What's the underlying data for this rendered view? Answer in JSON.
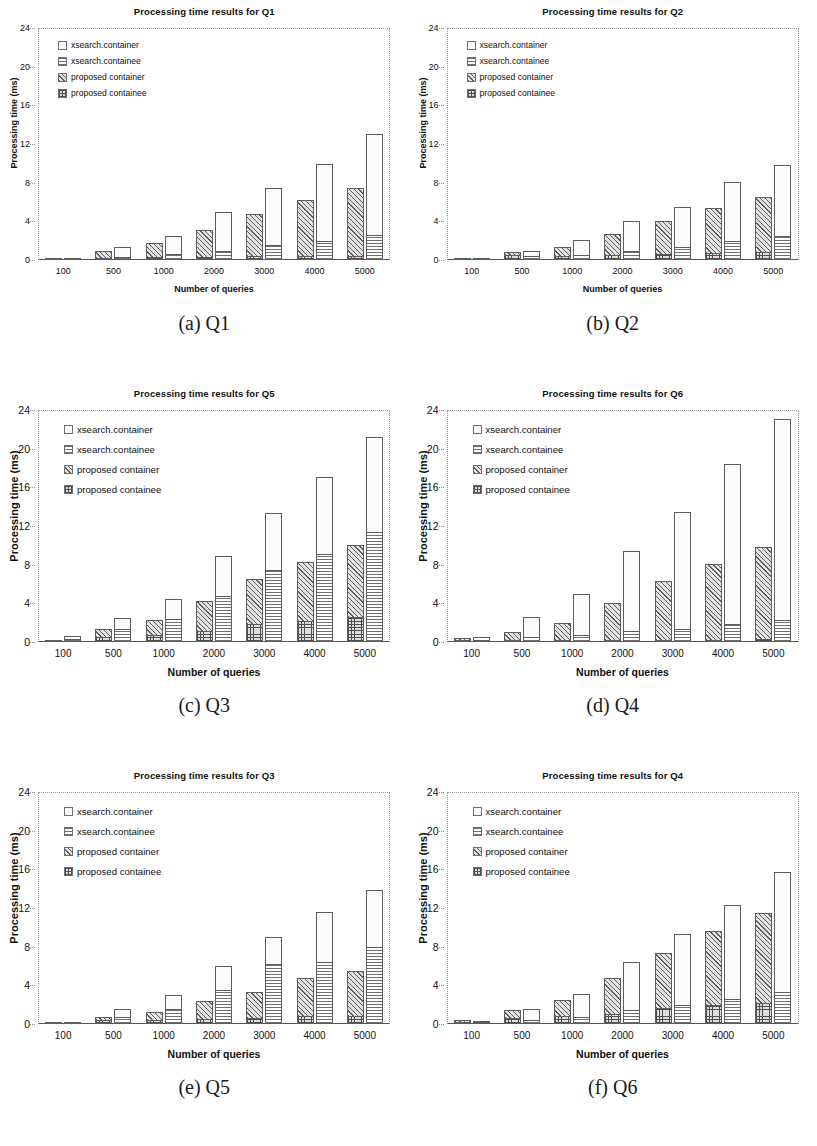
{
  "figure": {
    "axis": {
      "ylabel": "Processing time (ms)",
      "xlabel": "Number of queries",
      "yticks": [
        "0",
        "4",
        "8",
        "12",
        "16",
        "20",
        "24"
      ],
      "xticks": [
        "100",
        "500",
        "1000",
        "2000",
        "3000",
        "4000",
        "5000"
      ],
      "ymin": 0,
      "ymax": 24,
      "ystep": 4
    },
    "legend": [
      {
        "label": "xsearch.container",
        "pattern": "dots",
        "key": "xsearch_container"
      },
      {
        "label": "xsearch.containee",
        "pattern": "hlines",
        "key": "xsearch_containee"
      },
      {
        "label": "proposed  container",
        "pattern": "diag",
        "key": "proposed_container"
      },
      {
        "label": "proposed  containee",
        "pattern": "grid",
        "key": "proposed_containee"
      }
    ],
    "panels": [
      {
        "caption": "(a) Q1",
        "title": "Processing time results for Q1",
        "chart": "q1"
      },
      {
        "caption": "(b) Q2",
        "title": "Processing time results for Q2",
        "chart": "q2"
      },
      {
        "caption": "(c) Q3",
        "title": "Processing time results for Q5",
        "chart": "q5"
      },
      {
        "caption": "(d) Q4",
        "title": "Processing time results for Q6",
        "chart": "q6"
      },
      {
        "caption": "(e) Q5",
        "title": "Processing time results for Q3",
        "chart": "q3"
      },
      {
        "caption": "(f) Q6",
        "title": "Processing time results for Q4",
        "chart": "q4"
      }
    ]
  },
  "chart_data": [
    {
      "id": "q1",
      "type": "bar",
      "stacked": true,
      "title": "Processing time results for Q1",
      "xlabel": "Number of queries",
      "ylabel": "Processing time (ms)",
      "ylim": [
        0,
        24
      ],
      "yticks": [
        0,
        4,
        8,
        12,
        16,
        20,
        24
      ],
      "grid": false,
      "legend_position": "inside-top-left",
      "categories": [
        "100",
        "500",
        "1000",
        "2000",
        "3000",
        "4000",
        "5000"
      ],
      "series": [
        {
          "name": "proposed  containee",
          "values": [
            0.05,
            0.12,
            0.18,
            0.25,
            0.3,
            0.32,
            0.35
          ]
        },
        {
          "name": "proposed  container",
          "values": [
            0.1,
            0.78,
            1.62,
            2.85,
            4.5,
            5.9,
            7.1
          ]
        },
        {
          "name": "xsearch.containee",
          "values": [
            0.05,
            0.25,
            0.6,
            0.9,
            1.5,
            1.85,
            2.5
          ]
        },
        {
          "name": "xsearch.container",
          "values": [
            0.1,
            1.1,
            1.9,
            4.1,
            5.9,
            8.1,
            10.5
          ]
        }
      ],
      "totals": {
        "proposed": [
          0.15,
          0.9,
          1.8,
          3.1,
          4.8,
          6.2,
          7.45
        ],
        "xsearch": [
          0.15,
          1.35,
          2.5,
          5.0,
          7.4,
          9.95,
          13.0
        ]
      }
    },
    {
      "id": "q2",
      "type": "bar",
      "stacked": true,
      "title": "Processing time results for Q2",
      "xlabel": "Number of queries",
      "ylabel": "Processing time (ms)",
      "ylim": [
        0,
        24
      ],
      "yticks": [
        0,
        4,
        8,
        12,
        16,
        20,
        24
      ],
      "grid": false,
      "legend_position": "inside-top-left",
      "categories": [
        "100",
        "500",
        "1000",
        "2000",
        "3000",
        "4000",
        "5000"
      ],
      "series": [
        {
          "name": "proposed  containee",
          "values": [
            0.08,
            0.6,
            0.3,
            0.4,
            0.5,
            0.6,
            0.75
          ]
        },
        {
          "name": "proposed  container",
          "values": [
            0.07,
            0.2,
            1.05,
            2.3,
            3.5,
            4.75,
            5.75
          ]
        },
        {
          "name": "xsearch.containee",
          "values": [
            0.08,
            0.4,
            0.45,
            0.85,
            1.3,
            1.9,
            2.4
          ]
        },
        {
          "name": "xsearch.container",
          "values": [
            0.07,
            0.5,
            1.65,
            3.15,
            4.2,
            6.2,
            7.4
          ]
        }
      ],
      "totals": {
        "proposed": [
          0.15,
          0.8,
          1.35,
          2.7,
          4.0,
          5.35,
          6.5
        ],
        "xsearch": [
          0.15,
          0.9,
          2.1,
          4.0,
          5.5,
          8.1,
          9.8
        ]
      }
    },
    {
      "id": "q5",
      "type": "bar",
      "stacked": true,
      "title": "Processing time results for Q5",
      "xlabel": "Number of queries",
      "ylabel": "Processing time (ms)",
      "ylim": [
        0,
        24
      ],
      "yticks": [
        0,
        4,
        8,
        12,
        16,
        20,
        24
      ],
      "grid": false,
      "legend_position": "inside-top-left",
      "categories": [
        "100",
        "500",
        "1000",
        "2000",
        "3000",
        "4000",
        "5000"
      ],
      "series": [
        {
          "name": "proposed  containee",
          "values": [
            0.15,
            0.45,
            0.7,
            1.1,
            1.8,
            2.1,
            2.5
          ]
        },
        {
          "name": "proposed  container",
          "values": [
            0.1,
            0.85,
            1.6,
            3.1,
            4.7,
            6.15,
            7.55
          ]
        },
        {
          "name": "xsearch.containee",
          "values": [
            0.2,
            1.4,
            2.4,
            4.8,
            7.5,
            9.1,
            11.4
          ]
        },
        {
          "name": "xsearch.container",
          "values": [
            0.4,
            1.1,
            2.1,
            4.1,
            5.8,
            8.0,
            9.8
          ]
        }
      ],
      "totals": {
        "proposed": [
          0.25,
          1.3,
          2.3,
          4.2,
          6.5,
          8.25,
          10.05
        ],
        "xsearch": [
          0.6,
          2.5,
          4.5,
          8.9,
          13.3,
          17.1,
          21.2
        ]
      }
    },
    {
      "id": "q6",
      "type": "bar",
      "stacked": true,
      "title": "Processing time results for Q6",
      "xlabel": "Number of queries",
      "ylabel": "Processing time (ms)",
      "ylim": [
        0,
        24
      ],
      "yticks": [
        0,
        4,
        8,
        12,
        16,
        20,
        24
      ],
      "grid": false,
      "legend_position": "inside-top-left",
      "categories": [
        "100",
        "500",
        "1000",
        "2000",
        "3000",
        "4000",
        "5000"
      ],
      "series": [
        {
          "name": "proposed  containee",
          "values": [
            0.1,
            0.08,
            0.1,
            0.12,
            0.15,
            0.15,
            0.18
          ]
        },
        {
          "name": "proposed  container",
          "values": [
            0.3,
            0.92,
            1.9,
            3.88,
            6.15,
            7.95,
            9.62
          ]
        },
        {
          "name": "xsearch.containee",
          "values": [
            0.15,
            0.4,
            0.65,
            1.05,
            1.3,
            1.8,
            2.2
          ]
        },
        {
          "name": "xsearch.container",
          "values": [
            0.4,
            2.15,
            4.35,
            8.35,
            12.1,
            16.6,
            20.9
          ]
        }
      ],
      "totals": {
        "proposed": [
          0.4,
          1.0,
          2.0,
          4.0,
          6.3,
          8.1,
          9.8
        ],
        "xsearch": [
          0.55,
          2.55,
          5.0,
          9.4,
          13.4,
          18.4,
          23.1
        ]
      }
    },
    {
      "id": "q3",
      "type": "bar",
      "stacked": true,
      "title": "Processing time results for Q3",
      "xlabel": "Number of queries",
      "ylabel": "Processing time (ms)",
      "ylim": [
        0,
        24
      ],
      "yticks": [
        0,
        4,
        8,
        12,
        16,
        20,
        24
      ],
      "grid": false,
      "legend_position": "inside-top-left",
      "categories": [
        "100",
        "500",
        "1000",
        "2000",
        "3000",
        "4000",
        "5000"
      ],
      "series": [
        {
          "name": "proposed  containee",
          "values": [
            0.08,
            0.45,
            0.35,
            0.5,
            0.6,
            0.7,
            0.75
          ]
        },
        {
          "name": "proposed  container",
          "values": [
            0.07,
            0.3,
            0.9,
            1.85,
            2.75,
            4.1,
            4.75
          ]
        },
        {
          "name": "xsearch.containee",
          "values": [
            0.1,
            0.75,
            1.55,
            3.5,
            6.2,
            6.4,
            8.0
          ]
        },
        {
          "name": "xsearch.container",
          "values": [
            0.15,
            0.85,
            1.45,
            2.5,
            2.75,
            5.2,
            5.9
          ]
        }
      ],
      "totals": {
        "proposed": [
          0.15,
          0.75,
          1.25,
          2.35,
          3.35,
          4.8,
          5.5
        ],
        "xsearch": [
          0.25,
          1.6,
          3.0,
          6.0,
          8.95,
          11.6,
          13.9
        ]
      }
    },
    {
      "id": "q4",
      "type": "bar",
      "stacked": true,
      "title": "Processing time results for Q4",
      "xlabel": "Number of queries",
      "ylabel": "Processing time (ms)",
      "ylim": [
        0,
        24
      ],
      "yticks": [
        0,
        4,
        8,
        12,
        16,
        20,
        24
      ],
      "grid": false,
      "legend_position": "inside-top-left",
      "categories": [
        "100",
        "500",
        "1000",
        "2000",
        "3000",
        "4000",
        "5000"
      ],
      "series": [
        {
          "name": "proposed  containee",
          "values": [
            0.2,
            0.55,
            0.75,
            1.0,
            1.6,
            1.85,
            2.1
          ]
        },
        {
          "name": "proposed  container",
          "values": [
            0.2,
            0.95,
            1.75,
            3.8,
            5.75,
            7.75,
            9.35
          ]
        },
        {
          "name": "xsearch.containee",
          "values": [
            0.1,
            0.35,
            0.65,
            1.35,
            1.95,
            2.5,
            3.2
          ]
        },
        {
          "name": "xsearch.container",
          "values": [
            0.2,
            1.25,
            2.45,
            5.05,
            7.35,
            9.8,
            12.5
          ]
        }
      ],
      "totals": {
        "proposed": [
          0.4,
          1.5,
          2.5,
          4.8,
          7.35,
          9.6,
          11.45
        ],
        "xsearch": [
          0.3,
          1.6,
          3.1,
          6.4,
          9.3,
          12.3,
          15.7
        ]
      }
    }
  ]
}
